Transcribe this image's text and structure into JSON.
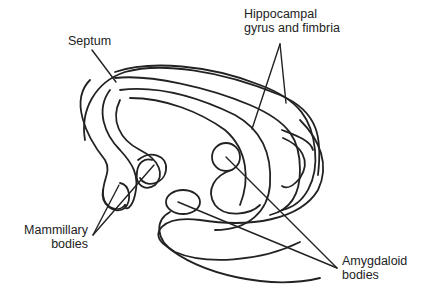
{
  "figure": {
    "line_color": "#222222",
    "background": "#ffffff"
  },
  "labels": {
    "septum": "Septum",
    "hippocampal_line1": "Hippocampal",
    "hippocampal_line2": "gyrus and fimbria",
    "mammillary_line1": "Mammillary",
    "mammillary_line2": "bodies",
    "amygdaloid_line1": "Amygdaloid",
    "amygdaloid_line2": "bodies"
  }
}
